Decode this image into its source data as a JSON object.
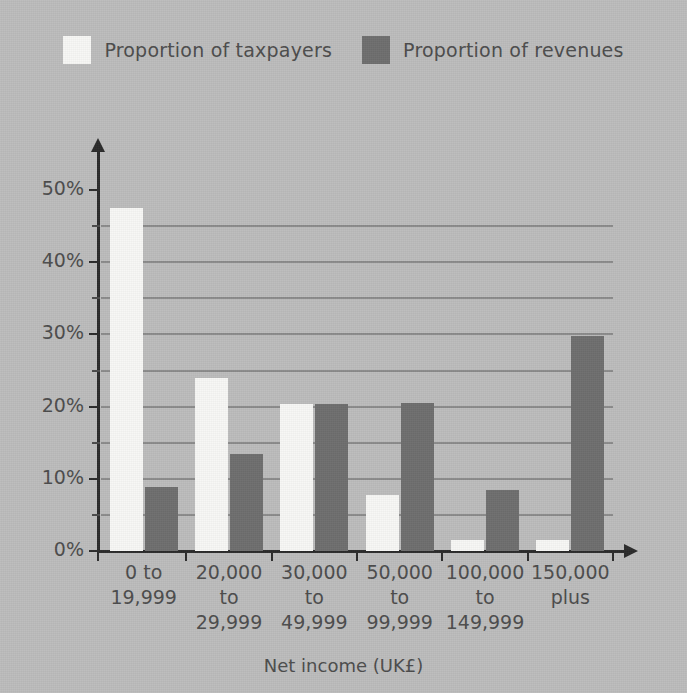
{
  "chart_data": {
    "type": "bar",
    "title": "",
    "xlabel": "Net income (UK£)",
    "ylabel": "",
    "categories": [
      "0 to\n19,999",
      "20,000\nto\n29,999",
      "30,000\nto\n49,999",
      "50,000\nto\n99,999",
      "100,000\nto\n149,999",
      "150,000\nplus"
    ],
    "series": [
      {
        "name": "Proportion of taxpayers",
        "color": "#f7f7f5",
        "values": [
          47.5,
          24.0,
          20.3,
          7.8,
          1.5,
          1.5
        ]
      },
      {
        "name": "Proportion of revenues",
        "color": "#6e6e6e",
        "values": [
          8.9,
          13.4,
          20.4,
          20.5,
          8.5,
          29.8
        ]
      }
    ],
    "ylim": [
      0,
      55
    ],
    "ytick_values": [
      0,
      10,
      20,
      30,
      40,
      50
    ],
    "ytick_labels": [
      "0%",
      "10%",
      "20%",
      "30%",
      "40%",
      "50%"
    ],
    "yminor_tick_values": [
      5,
      15,
      25,
      35,
      45
    ],
    "gridline_values": [
      5,
      10,
      15,
      20,
      25,
      30,
      35,
      40,
      45
    ],
    "grid": true,
    "legend_position": "top-center",
    "background_color": "#bcbcbc",
    "axis_color": "#2b2b2b",
    "grid_color": "#8b8b8b",
    "text_color": "#4c4c4c"
  },
  "legend": {
    "entries": [
      {
        "label": "Proportion of taxpayers",
        "color": "#f7f7f5"
      },
      {
        "label": "Proportion of revenues",
        "color": "#6e6e6e"
      }
    ]
  }
}
